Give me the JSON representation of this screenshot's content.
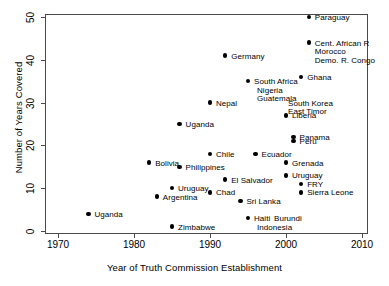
{
  "chart_data": {
    "type": "scatter",
    "title": "",
    "xlabel": "Year of Truth Commission Establishment",
    "ylabel": "Number of Years Covered",
    "xlim": [
      1970,
      2010
    ],
    "ylim": [
      0,
      50
    ],
    "xticks": [
      1970,
      1980,
      1990,
      2000,
      2010
    ],
    "yticks": [
      0,
      10,
      20,
      30,
      40,
      50
    ],
    "grid": false,
    "legend": null,
    "points": [
      {
        "label": "Uganda",
        "x": 1974,
        "y": 4,
        "label_dx": 6,
        "label_dy": -3,
        "marker": true
      },
      {
        "label": "Bolivia",
        "x": 1982,
        "y": 16,
        "label_dx": 6,
        "label_dy": -3,
        "marker": true
      },
      {
        "label": "Argentina",
        "x": 1983,
        "y": 8,
        "label_dx": 6,
        "label_dy": -3,
        "marker": true
      },
      {
        "label": "Uruguay",
        "x": 1985,
        "y": 10,
        "label_dx": 6,
        "label_dy": -3,
        "marker": true
      },
      {
        "label": "Zimbabwe",
        "x": 1985,
        "y": 1,
        "label_dx": 6,
        "label_dy": -3,
        "marker": true
      },
      {
        "label": "Uganda",
        "x": 1986,
        "y": 25,
        "label_dx": 6,
        "label_dy": -3,
        "marker": true
      },
      {
        "label": "Philippines",
        "x": 1986,
        "y": 15,
        "label_dx": 6,
        "label_dy": -3,
        "marker": true
      },
      {
        "label": "Chile",
        "x": 1990,
        "y": 18,
        "label_dx": 6,
        "label_dy": -3,
        "marker": true
      },
      {
        "label": "Chad",
        "x": 1990,
        "y": 9,
        "label_dx": 6,
        "label_dy": -3,
        "marker": true
      },
      {
        "label": "Germany",
        "x": 1992,
        "y": 41,
        "label_dx": 6,
        "label_dy": -3,
        "marker": true
      },
      {
        "label": "Nepal",
        "x": 1990,
        "y": 30,
        "label_dx": 6,
        "label_dy": -3,
        "marker": true
      },
      {
        "label": "El Salvador",
        "x": 1992,
        "y": 12,
        "label_dx": 6,
        "label_dy": -3,
        "marker": true
      },
      {
        "label": "Sri Lanka",
        "x": 1994,
        "y": 7,
        "label_dx": 6,
        "label_dy": -3,
        "marker": true
      },
      {
        "label": "South Africa",
        "x": 1995,
        "y": 35,
        "label_dx": 6,
        "label_dy": -3,
        "marker": true
      },
      {
        "label": "Nigeria",
        "x": 1995,
        "y": 33,
        "label_dx": 9,
        "label_dy": -3,
        "marker": false
      },
      {
        "label": "Guatemala",
        "x": 1995,
        "y": 31,
        "label_dx": 9,
        "label_dy": -3,
        "marker": false
      },
      {
        "label": "Haiti",
        "x": 1995,
        "y": 3,
        "label_dx": 6,
        "label_dy": -3,
        "marker": true
      },
      {
        "label": "Burundi",
        "x": 1995,
        "y": 3,
        "label_dx": 26,
        "label_dy": -3,
        "marker": false
      },
      {
        "label": "Indonesia",
        "x": 1995,
        "y": 1,
        "label_dx": 9,
        "label_dy": -3,
        "marker": false
      },
      {
        "label": "Ecuador",
        "x": 1996,
        "y": 18,
        "label_dx": 6,
        "label_dy": -3,
        "marker": true
      },
      {
        "label": "South Korea",
        "x": 2000,
        "y": 30,
        "label_dx": 2,
        "label_dy": -3,
        "marker": false
      },
      {
        "label": "East Timor",
        "x": 2000,
        "y": 28,
        "label_dx": 2,
        "label_dy": -3,
        "marker": false
      },
      {
        "label": "Liberia",
        "x": 2000,
        "y": 27,
        "label_dx": 6,
        "label_dy": -3,
        "marker": true
      },
      {
        "label": "Panama",
        "x": 2001,
        "y": 22,
        "label_dx": 6,
        "label_dy": -3,
        "marker": true
      },
      {
        "label": "Peru",
        "x": 2001,
        "y": 21,
        "label_dx": 6,
        "label_dy": -3,
        "marker": true
      },
      {
        "label": "Grenada",
        "x": 2000,
        "y": 16,
        "label_dx": 6,
        "label_dy": -3,
        "marker": true
      },
      {
        "label": "Uruguay",
        "x": 2000,
        "y": 13,
        "label_dx": 6,
        "label_dy": -3,
        "marker": true
      },
      {
        "label": "FRY",
        "x": 2002,
        "y": 11,
        "label_dx": 6,
        "label_dy": -3,
        "marker": true
      },
      {
        "label": "Sierra Leone",
        "x": 2002,
        "y": 9,
        "label_dx": 6,
        "label_dy": -3,
        "marker": true
      },
      {
        "label": "Ghana",
        "x": 2002,
        "y": 36,
        "label_dx": 6,
        "label_dy": -3,
        "marker": true
      },
      {
        "label": "Paraguay",
        "x": 2003,
        "y": 50,
        "label_dx": 6,
        "label_dy": -3,
        "marker": true
      },
      {
        "label": "Cent. African R",
        "x": 2003,
        "y": 44,
        "label_dx": 6,
        "label_dy": -3,
        "marker": true
      },
      {
        "label": "Morocco",
        "x": 2003,
        "y": 42,
        "label_dx": 6,
        "label_dy": -3,
        "marker": false
      },
      {
        "label": "Demo. R. Congo",
        "x": 2003,
        "y": 40,
        "label_dx": 6,
        "label_dy": -3,
        "marker": false
      }
    ]
  }
}
